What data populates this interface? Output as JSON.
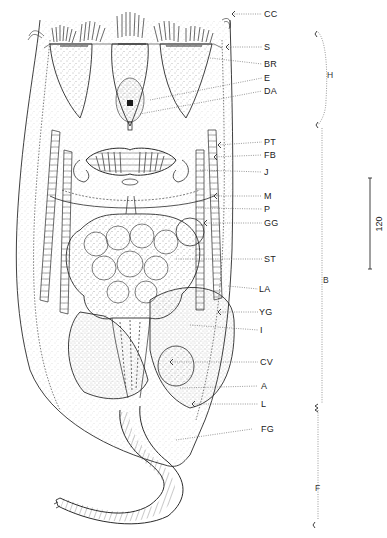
{
  "figure": {
    "type": "anatomical line drawing (rotifer, dorsal view)",
    "ink_color": "#2a2a2a",
    "background": "#ffffff"
  },
  "labels": [
    {
      "id": "CC",
      "text": "CC",
      "y": 14
    },
    {
      "id": "S",
      "text": "S",
      "y": 47
    },
    {
      "id": "BR",
      "text": "BR",
      "y": 64
    },
    {
      "id": "E",
      "text": "E",
      "y": 78
    },
    {
      "id": "DA",
      "text": "DA",
      "y": 91
    },
    {
      "id": "PT",
      "text": "PT",
      "y": 142
    },
    {
      "id": "FB",
      "text": "FB",
      "y": 155
    },
    {
      "id": "J",
      "text": "J",
      "y": 172
    },
    {
      "id": "M",
      "text": "M",
      "y": 196
    },
    {
      "id": "P",
      "text": "P",
      "y": 209
    },
    {
      "id": "GG",
      "text": "GG",
      "y": 223
    },
    {
      "id": "ST",
      "text": "ST",
      "y": 259
    },
    {
      "id": "LA",
      "text": "LA",
      "y": 289
    },
    {
      "id": "YG",
      "text": "YG",
      "y": 312
    },
    {
      "id": "I",
      "text": "I",
      "y": 330
    },
    {
      "id": "CV",
      "text": "CV",
      "y": 362
    },
    {
      "id": "A",
      "text": "A",
      "y": 386
    },
    {
      "id": "L",
      "text": "L",
      "y": 404
    },
    {
      "id": "FG",
      "text": "FG",
      "y": 429
    }
  ],
  "regions": [
    {
      "id": "H",
      "text": "H",
      "top": 32,
      "bottom": 125
    },
    {
      "id": "B",
      "text": "B",
      "top": 125,
      "bottom": 408
    },
    {
      "id": "F",
      "text": "F",
      "top": 408,
      "bottom": 528
    }
  ],
  "scale_bar": {
    "value": "120",
    "top": 178,
    "bottom": 269,
    "x": 370
  }
}
